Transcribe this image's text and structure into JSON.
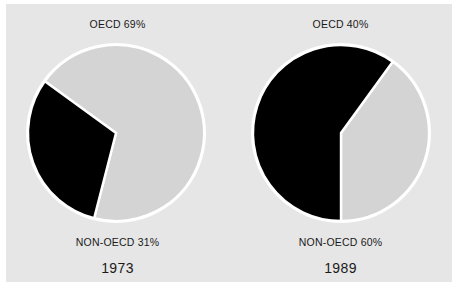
{
  "figure": {
    "background": "#e6e6e6",
    "page_background": "#ffffff",
    "slice_colors": {
      "oecd": "#d4d4d4",
      "non_oecd": "#000000",
      "separator": "#ffffff"
    }
  },
  "chart_data": {
    "type": "pie",
    "title": "",
    "xlabel": "",
    "ylabel": "",
    "legend_position": "none",
    "grid": false,
    "charts": [
      {
        "name": "1973",
        "year_label": "1973",
        "top_label": "OECD 69%",
        "bottom_label": "NON-OECD 31%",
        "categories": [
          "OECD",
          "NON-OECD"
        ],
        "values": [
          69,
          31
        ],
        "units": "percent",
        "colors": [
          "#d4d4d4",
          "#000000"
        ]
      },
      {
        "name": "1989",
        "year_label": "1989",
        "top_label": "OECD 40%",
        "bottom_label": "NON-OECD 60%",
        "categories": [
          "OECD",
          "NON-OECD"
        ],
        "values": [
          40,
          60
        ],
        "units": "percent",
        "colors": [
          "#d4d4d4",
          "#000000"
        ]
      }
    ]
  }
}
